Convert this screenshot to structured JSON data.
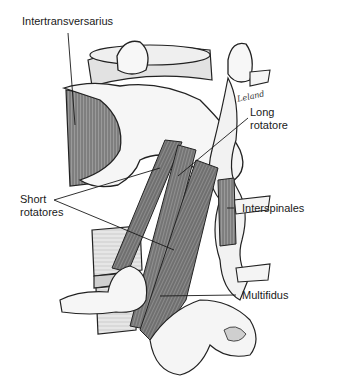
{
  "figure": {
    "signature": "Leland",
    "labels": [
      {
        "id": "intertransversarius",
        "text": "Intertransversarius"
      },
      {
        "id": "long-rotatore",
        "line1": "Long",
        "line2": "rotatore"
      },
      {
        "id": "short-rotatores",
        "line1": "Short",
        "line2": "rotatores"
      },
      {
        "id": "interspinales",
        "text": "Interspinales"
      },
      {
        "id": "multifidus",
        "text": "Multifidus"
      }
    ]
  },
  "colors": {
    "background": "#ffffff",
    "ink": "#1a1a1a",
    "bone": "#f4f4f4",
    "muscle": "#8a8a8a",
    "body": "#d8d8d8"
  }
}
